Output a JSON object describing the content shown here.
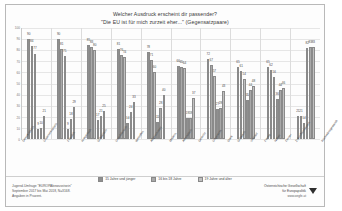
{
  "title": {
    "line1": "Welcher Ausdruck erscheint dir passender?",
    "line2": "\"Die EU ist für mich zurzeit eher...\" (Gegensatzpaare)"
  },
  "legend": [
    {
      "label": "15 Jahre und jünger",
      "color": "#8f8f8f"
    },
    {
      "label": "16 bis 18 Jahre",
      "color": "#a8a8a8"
    },
    {
      "label": "19 Jahre und älter",
      "color": "#c0c0c0"
    }
  ],
  "footer": {
    "source_line1": "Jugend-Umfrage \"EUROPAbewusstsein\"",
    "source_line2": "September 2017 bis Mai 2018, N=3168.",
    "source_line3": "Angaben in Prozent.",
    "org_line1": "Österreichische Gesellschaft",
    "org_line2": "für Europapolitik",
    "org_url": "www.oegfe.at"
  },
  "chart_data": {
    "type": "bar",
    "title": "Welcher Ausdruck erscheint dir passender? \"Die EU ist für mich zurzeit eher...\" (Gegensatzpaare)",
    "xlabel": "",
    "ylabel": "",
    "ylim": [
      0,
      100
    ],
    "yticks": [
      0,
      10,
      20,
      30,
      40,
      50,
      60,
      70,
      80,
      90,
      100
    ],
    "grid": true,
    "legend_position": "bottom",
    "units": "Prozent",
    "categories": [
      "Demokratisch / Undemokratisch",
      "Friedlich / Kriegerisch",
      "Solidarisch / Unsolidarisch",
      "Weltoffen / Abgeschottet",
      "Modern / Altmodisch",
      "Gerecht / Ungerecht",
      "Stark / Schwach",
      "Vertraut / Fremd",
      "Näher / Ferner",
      "Zukunftsorientiert / Rückwärtsgewandt"
    ],
    "series": [
      {
        "name": "15 Jahre und jünger",
        "values_left": [
          90,
          90,
          85,
          81,
          78,
          66,
          72,
          65,
          65,
          21
        ],
        "values_right": [
          9,
          9,
          17,
          14,
          15,
          19,
          27,
          35,
          36,
          82
        ]
      },
      {
        "name": "16 bis 18 Jahre",
        "values_left": [
          84,
          81,
          83,
          76,
          71,
          65,
          67,
          61,
          62,
          21
        ],
        "values_right": [
          10,
          18,
          21,
          24,
          28,
          19,
          28,
          44,
          44,
          83
        ]
      },
      {
        "name": "19 Jahre und älter",
        "values_left": [
          77,
          75,
          80,
          74,
          60,
          64,
          57,
          54,
          56,
          14
        ],
        "values_right": [
          21,
          29,
          25,
          33,
          40,
          37,
          43,
          48,
          46,
          83
        ]
      }
    ],
    "bar_groups": [
      {
        "category": "Demokratisch / Undemokratisch",
        "bars": [
          90,
          84,
          77,
          9,
          10,
          21
        ]
      },
      {
        "category": "Friedlich / Kriegerisch",
        "bars": [
          90,
          81,
          75,
          9,
          18,
          29
        ]
      },
      {
        "category": "Solidarisch / Unsolidarisch",
        "bars": [
          85,
          83,
          80,
          17,
          21,
          25
        ]
      },
      {
        "category": "Weltoffen / Abgeschottet",
        "bars": [
          81,
          76,
          74,
          14,
          24,
          33
        ]
      },
      {
        "category": "Modern / Altmodisch",
        "bars": [
          78,
          71,
          60,
          15,
          28,
          40
        ]
      },
      {
        "category": "Gerecht / Ungerecht",
        "bars": [
          66,
          65,
          64,
          19,
          19,
          37
        ]
      },
      {
        "category": "Stark / Schwach",
        "bars": [
          72,
          67,
          57,
          27,
          28,
          43
        ]
      },
      {
        "category": "Vertraut / Fremd",
        "bars": [
          65,
          61,
          54,
          35,
          44,
          48
        ]
      },
      {
        "category": "Näher / Ferner",
        "bars": [
          65,
          62,
          56,
          36,
          44,
          46
        ]
      },
      {
        "category": "Zukunftsorientiert / Rückwärtsgewandt",
        "bars": [
          21,
          21,
          14,
          82,
          83,
          83
        ]
      }
    ]
  }
}
